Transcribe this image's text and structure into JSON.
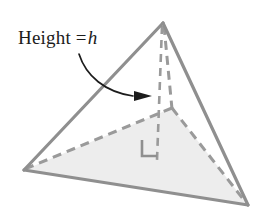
{
  "figure": {
    "name": "triangular-pyramid-height-diagram",
    "caption_label": "Height =",
    "caption_variable": "h",
    "colors": {
      "solid_edge": "#8f8f8f",
      "dashed_edge": "#9a9a9a",
      "base_fill": "#ededed",
      "annotation": "#1c1c1c",
      "background": "#ffffff",
      "right_angle": "#8f8f8f"
    },
    "vertices": {
      "apex": [
        163,
        23
      ],
      "front_left": [
        24,
        170
      ],
      "front_right": [
        248,
        205
      ],
      "back": [
        172,
        108
      ],
      "foot_of_height": [
        157,
        156
      ]
    },
    "edges": [
      {
        "name": "apex-to-front-left",
        "style": "solid"
      },
      {
        "name": "apex-to-front-right",
        "style": "solid"
      },
      {
        "name": "front-left-to-front-right",
        "style": "solid"
      },
      {
        "name": "apex-to-back",
        "style": "dashed"
      },
      {
        "name": "back-to-front-left",
        "style": "dashed"
      },
      {
        "name": "back-to-front-right",
        "style": "dashed"
      },
      {
        "name": "height-segment",
        "style": "dashed"
      }
    ],
    "right_angle_marker": {
      "label": "right-angle-marker",
      "size": 15
    },
    "arrow": {
      "label": "curved-pointer-arrow",
      "direction": "right"
    }
  }
}
